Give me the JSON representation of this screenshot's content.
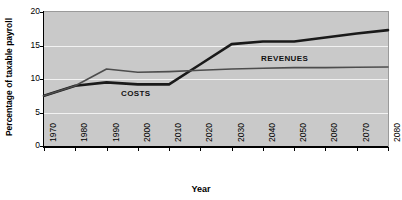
{
  "chart_data": {
    "type": "line",
    "title": "",
    "xlabel": "Year",
    "ylabel": "Percentage of taxable payroll",
    "x": [
      1970,
      1980,
      1990,
      2000,
      2010,
      2020,
      2030,
      2040,
      2050,
      2060,
      2070,
      2080
    ],
    "categories": [
      "1970",
      "1980",
      "1990",
      "2000",
      "2010",
      "2020",
      "2030",
      "2040",
      "2050",
      "2060",
      "2070",
      "2080"
    ],
    "xlim": [
      1970,
      2080
    ],
    "ylim": [
      0,
      20
    ],
    "yticks": [
      0,
      5,
      10,
      15,
      20
    ],
    "ytick_labels": [
      "0",
      "5",
      "10",
      "15",
      "20"
    ],
    "grid": true,
    "grid_color": "#f2f2f2",
    "plot_background": "#c9c9c9",
    "legend_position": "inline-annotations",
    "series": [
      {
        "name": "COSTS",
        "color": "#1a1a1a",
        "line_width": 2.6,
        "values": [
          7.5,
          9.0,
          9.5,
          9.2,
          9.2,
          12.2,
          15.2,
          15.6,
          15.6,
          16.2,
          16.8,
          17.3
        ]
      },
      {
        "name": "REVENUES",
        "color": "#4d4d4d",
        "line_width": 1.6,
        "values": [
          7.5,
          9.0,
          11.5,
          11.0,
          11.1,
          11.3,
          11.5,
          11.6,
          11.7,
          11.7,
          11.75,
          11.8
        ]
      }
    ],
    "annotations": [
      {
        "text": "COSTS",
        "x": 2000,
        "y": 8.2
      },
      {
        "text": "REVENUES",
        "x": 2043,
        "y": 13.6
      }
    ]
  },
  "axes": {
    "y_title": "Percentage of taxable payroll",
    "x_title": "Year"
  }
}
